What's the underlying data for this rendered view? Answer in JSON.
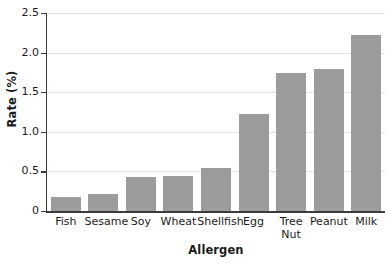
{
  "chart_data": {
    "type": "bar",
    "title": "",
    "xlabel": "Allergen",
    "ylabel": "Rate (%)",
    "categories": [
      "Fish",
      "Sesame",
      "Soy",
      "Wheat",
      "Shellfish",
      "Egg",
      "Tree\nNut",
      "Peanut",
      "Milk"
    ],
    "values": [
      0.18,
      0.22,
      0.43,
      0.44,
      0.54,
      1.22,
      1.74,
      1.79,
      2.22
    ],
    "ylim": [
      0,
      2.5
    ],
    "ytick_labels": [
      "0",
      "0.5",
      "1.0",
      "1.5",
      "2.0",
      "2.5"
    ],
    "ytick_values": [
      0,
      0.5,
      1.0,
      1.5,
      2.0,
      2.5
    ],
    "grid": "horizontal",
    "legend": "none",
    "bar_color": "#9c9c9c",
    "grid_color": "#e2e2e2",
    "axis_color": "#3b3b3b"
  }
}
